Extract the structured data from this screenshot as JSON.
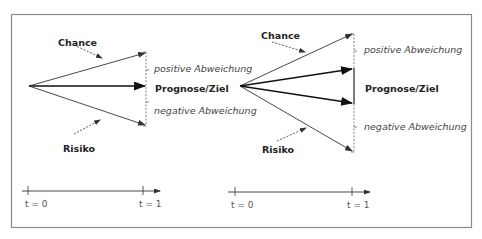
{
  "diagrams": [
    {
      "id": "left",
      "chance_label": "Chance",
      "risiko_label": "Risiko",
      "positive_label": "positive Abweichung",
      "target_label": "Prognose/Ziel",
      "negative_label": "negative Abweichung",
      "time_axis": {
        "start_label": "t = 0",
        "end_label": "t = 1"
      }
    },
    {
      "id": "right",
      "chance_label": "Chance",
      "risiko_label": "Risiko",
      "positive_label": "positive Abweichung",
      "target_label": "Prognose/Ziel",
      "negative_label": "negative Abweichung",
      "time_axis": {
        "start_label": "t = 0",
        "end_label": "t = 1"
      }
    }
  ],
  "colors": {
    "frame": "#8a8a8a",
    "arrow": "#333333",
    "arrow_bold": "#111111",
    "dashed": "#666666"
  }
}
